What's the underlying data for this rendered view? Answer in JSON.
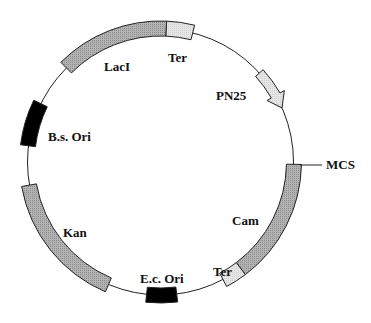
{
  "diagram": {
    "type": "plasmid-map",
    "center": [
      160.5,
      162
    ],
    "radius": 133,
    "band_inner": 126,
    "band_outer": 141,
    "colors": {
      "backbone": "#222222",
      "gene_dark": "#b4b4b4",
      "gene_light": "#e6e6e6",
      "origin": "#000000"
    },
    "features": [
      {
        "id": "laci",
        "name": "LacI",
        "kind": "gene",
        "start_deg": 315,
        "end_deg": 362.5,
        "fill": "dark"
      },
      {
        "id": "ter-top",
        "name": "Ter",
        "kind": "terminator",
        "start_deg": 362.5,
        "end_deg": 374,
        "fill": "light"
      },
      {
        "id": "pn25",
        "name": "PN25",
        "kind": "promoter-arrow",
        "start_deg": 48,
        "end_deg": 66,
        "fill": "light"
      },
      {
        "id": "cam",
        "name": "Cam",
        "kind": "gene",
        "start_deg": 91,
        "end_deg": 143,
        "fill": "dark"
      },
      {
        "id": "ter-bottom",
        "name": "Ter",
        "kind": "terminator",
        "start_deg": 143,
        "end_deg": 152,
        "fill": "light"
      },
      {
        "id": "ec-ori",
        "name": "E.c. Ori",
        "kind": "origin",
        "start_deg": 173,
        "end_deg": 186,
        "fill": "origin"
      },
      {
        "id": "kan",
        "name": "Kan",
        "kind": "gene",
        "start_deg": 203,
        "end_deg": 260,
        "fill": "dark"
      },
      {
        "id": "bs-ori",
        "name": "B.s. Ori",
        "kind": "origin",
        "start_deg": 277,
        "end_deg": 296,
        "fill": "origin"
      }
    ],
    "labels": [
      {
        "id": "laci",
        "text": "LacI",
        "x": 104,
        "y": 71
      },
      {
        "id": "ter-top",
        "text": "Ter",
        "x": 168,
        "y": 62
      },
      {
        "id": "pn25",
        "text": "PN25",
        "x": 216,
        "y": 100
      },
      {
        "id": "bs-ori",
        "text": "B.s. Ori",
        "x": 48,
        "y": 141
      },
      {
        "id": "mcs",
        "text": "MCS",
        "x": 326,
        "y": 169
      },
      {
        "id": "cam",
        "text": "Cam",
        "x": 232,
        "y": 225
      },
      {
        "id": "kan",
        "text": "Kan",
        "x": 63,
        "y": 237
      },
      {
        "id": "ter-bottom",
        "text": "Ter",
        "x": 213,
        "y": 276
      },
      {
        "id": "ec-ori",
        "text": "E.c. Ori",
        "x": 140,
        "y": 283
      }
    ],
    "mcs_marker": {
      "label": "MCS",
      "x1": 300,
      "y1": 165,
      "x2": 322,
      "y2": 165
    }
  }
}
